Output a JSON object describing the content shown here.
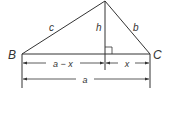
{
  "diagram": {
    "type": "triangle-altitude",
    "vertices": {
      "B": {
        "label": "B"
      },
      "C": {
        "label": "C"
      }
    },
    "sides": {
      "c": {
        "label": "c"
      },
      "b": {
        "label": "b"
      },
      "h": {
        "label": "h"
      }
    },
    "dimensions": {
      "left_segment": {
        "label": "a − x"
      },
      "right_segment": {
        "label": "x"
      },
      "base": {
        "label": "a"
      }
    },
    "colors": {
      "stroke": "#333333",
      "background": "#ffffff"
    }
  }
}
